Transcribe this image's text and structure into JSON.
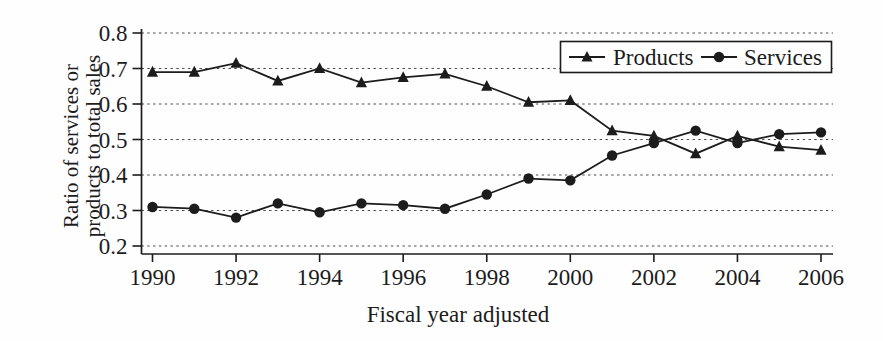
{
  "figure": {
    "background": "#fefefe",
    "line_color": "#1c1c1c",
    "grid_color": "#4a4a4a",
    "text_color": "#1c1c1c"
  },
  "chart_data": {
    "type": "line",
    "title": "",
    "xlabel": "Fiscal year adjusted",
    "ylabel": "Ratio of services or products to total sales",
    "ylabel_line1": "Ratio of services or",
    "ylabel_line2": "products to total sales",
    "x": [
      1990,
      1991,
      1992,
      1993,
      1994,
      1995,
      1996,
      1997,
      1998,
      1999,
      2000,
      2001,
      2002,
      2003,
      2004,
      2005,
      2006
    ],
    "series": [
      {
        "name": "Products",
        "marker": "triangle",
        "values": [
          0.69,
          0.69,
          0.715,
          0.665,
          0.7,
          0.66,
          0.675,
          0.685,
          0.65,
          0.605,
          0.61,
          0.525,
          0.51,
          0.46,
          0.51,
          0.48,
          0.47
        ]
      },
      {
        "name": "Services",
        "marker": "circle",
        "values": [
          0.31,
          0.305,
          0.28,
          0.32,
          0.295,
          0.32,
          0.315,
          0.305,
          0.345,
          0.39,
          0.385,
          0.455,
          0.49,
          0.525,
          0.49,
          0.515,
          0.52
        ]
      }
    ],
    "xlim": [
      1990,
      2006
    ],
    "ylim": [
      0.2,
      0.8
    ],
    "xticks": [
      1990,
      1992,
      1994,
      1996,
      1998,
      2000,
      2002,
      2004,
      2006
    ],
    "yticks": [
      0.2,
      0.3,
      0.4,
      0.5,
      0.6,
      0.7,
      0.8
    ],
    "grid": "horizontal-dashed",
    "legend_position": "top-right-inside"
  }
}
